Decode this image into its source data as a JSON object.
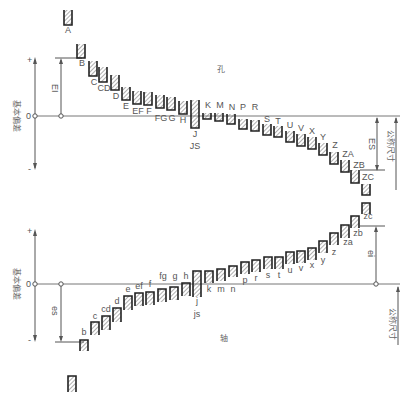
{
  "colors": {
    "line": "#555555",
    "box": "#222222",
    "hatch": "#777777",
    "text": "#555555"
  },
  "top": {
    "name": "孔",
    "axis_label": "基本偏差",
    "plus": "+",
    "minus": "-",
    "zero": "0",
    "dim_left": "EI",
    "dim_right": "ES",
    "size_label": "公称尺寸",
    "zero_y": 116,
    "items": [
      {
        "label": "A",
        "x": 68,
        "y1": 10,
        "y2": 25,
        "lx": 68,
        "ly": 33
      },
      {
        "label": "B",
        "x": 81,
        "y1": 44,
        "y2": 58,
        "lx": 82,
        "ly": 66
      },
      {
        "label": "C",
        "x": 93,
        "y1": 61,
        "y2": 76,
        "lx": 94,
        "ly": 85
      },
      {
        "label": "CD",
        "x": 103,
        "y1": 67,
        "y2": 82,
        "lx": 104,
        "ly": 91
      },
      {
        "label": "D",
        "x": 115,
        "y1": 75,
        "y2": 90,
        "lx": 116,
        "ly": 99
      },
      {
        "label": "E",
        "x": 126,
        "y1": 87,
        "y2": 100,
        "lx": 126,
        "ly": 109
      },
      {
        "label": "EF",
        "x": 137,
        "y1": 91,
        "y2": 104,
        "lx": 138,
        "ly": 114
      },
      {
        "label": "F",
        "x": 148,
        "y1": 92,
        "y2": 105,
        "lx": 149,
        "ly": 114
      },
      {
        "label": "FG",
        "x": 160,
        "y1": 95,
        "y2": 108,
        "lx": 161,
        "ly": 121
      },
      {
        "label": "G",
        "x": 171,
        "y1": 97,
        "y2": 110,
        "lx": 172,
        "ly": 121
      },
      {
        "label": "H",
        "x": 183,
        "y1": 101,
        "y2": 114,
        "lx": 183,
        "ly": 123
      },
      {
        "label": "J",
        "x": 195,
        "y1": 100,
        "y2": 128,
        "lx": 195,
        "ly": 137
      },
      {
        "label": "JS",
        "x": 195,
        "y1": 0,
        "y2": 0,
        "lx": 195,
        "ly": 149
      },
      {
        "label": "K",
        "x": 207,
        "y1": 113,
        "y2": 119,
        "lx": 208,
        "ly": 108
      },
      {
        "label": "M",
        "x": 219,
        "y1": 113,
        "y2": 121,
        "lx": 220,
        "ly": 108
      },
      {
        "label": "N",
        "x": 231,
        "y1": 114,
        "y2": 124,
        "lx": 232,
        "ly": 110
      },
      {
        "label": "P",
        "x": 243,
        "y1": 119,
        "y2": 129,
        "lx": 243,
        "ly": 110
      },
      {
        "label": "R",
        "x": 255,
        "y1": 120,
        "y2": 131,
        "lx": 255,
        "ly": 110
      },
      {
        "label": "S",
        "x": 267,
        "y1": 124,
        "y2": 135,
        "lx": 267,
        "ly": 122
      },
      {
        "label": "T",
        "x": 278,
        "y1": 126,
        "y2": 137,
        "lx": 278,
        "ly": 124
      },
      {
        "label": "U",
        "x": 290,
        "y1": 131,
        "y2": 142,
        "lx": 290,
        "ly": 128
      },
      {
        "label": "V",
        "x": 301,
        "y1": 134,
        "y2": 146,
        "lx": 301,
        "ly": 131
      },
      {
        "label": "X",
        "x": 312,
        "y1": 137,
        "y2": 149,
        "lx": 312,
        "ly": 134
      },
      {
        "label": "Y",
        "x": 323,
        "y1": 143,
        "y2": 155,
        "lx": 323,
        "ly": 140
      },
      {
        "label": "Z",
        "x": 334,
        "y1": 152,
        "y2": 164,
        "lx": 335,
        "ly": 148
      },
      {
        "label": "ZA",
        "x": 345,
        "y1": 160,
        "y2": 172,
        "lx": 348,
        "ly": 157
      },
      {
        "label": "ZB",
        "x": 355,
        "y1": 170,
        "y2": 183,
        "lx": 359,
        "ly": 168
      },
      {
        "label": "ZC",
        "x": 366,
        "y1": 184,
        "y2": 195,
        "lx": 368,
        "ly": 180
      }
    ]
  },
  "bottom": {
    "name": "轴",
    "axis_label": "基本偏差",
    "plus": "+",
    "minus": "-",
    "zero": "0",
    "dim_left": "es",
    "dim_right": "ei",
    "size_label": "公称尺寸",
    "zero_y": 284,
    "items": [
      {
        "label": "b",
        "x": 84,
        "y1": 340,
        "y2": 351,
        "lx": 84,
        "ly": 335
      },
      {
        "label": "c",
        "x": 95,
        "y1": 322,
        "y2": 335,
        "lx": 95,
        "ly": 319
      },
      {
        "label": "cd",
        "x": 106,
        "y1": 316,
        "y2": 330,
        "lx": 106,
        "ly": 312
      },
      {
        "label": "d",
        "x": 117,
        "y1": 308,
        "y2": 322,
        "lx": 117,
        "ly": 304
      },
      {
        "label": "e",
        "x": 128,
        "y1": 296,
        "y2": 310,
        "lx": 128,
        "ly": 292
      },
      {
        "label": "ef",
        "x": 139,
        "y1": 293,
        "y2": 306,
        "lx": 139,
        "ly": 289
      },
      {
        "label": "f",
        "x": 150,
        "y1": 292,
        "y2": 305,
        "lx": 150,
        "ly": 287
      },
      {
        "label": "fg",
        "x": 162,
        "y1": 289,
        "y2": 302,
        "lx": 163,
        "ly": 279
      },
      {
        "label": "g",
        "x": 174,
        "y1": 287,
        "y2": 300,
        "lx": 175,
        "ly": 279
      },
      {
        "label": "h",
        "x": 186,
        "y1": 283,
        "y2": 296,
        "lx": 186,
        "ly": 279
      },
      {
        "label": "j",
        "x": 197,
        "y1": 271,
        "y2": 297,
        "lx": 197,
        "ly": 304
      },
      {
        "label": "js",
        "x": 197,
        "y1": 0,
        "y2": 0,
        "lx": 197,
        "ly": 317
      },
      {
        "label": "k",
        "x": 209,
        "y1": 271,
        "y2": 283,
        "lx": 209,
        "ly": 292
      },
      {
        "label": "m",
        "x": 221,
        "y1": 269,
        "y2": 281,
        "lx": 221,
        "ly": 292
      },
      {
        "label": "n",
        "x": 233,
        "y1": 266,
        "y2": 277,
        "lx": 233,
        "ly": 292
      },
      {
        "label": "p",
        "x": 245,
        "y1": 262,
        "y2": 274,
        "lx": 245,
        "ly": 283
      },
      {
        "label": "r",
        "x": 256,
        "y1": 260,
        "y2": 272,
        "lx": 256,
        "ly": 281
      },
      {
        "label": "s",
        "x": 268,
        "y1": 257,
        "y2": 269,
        "lx": 268,
        "ly": 278
      },
      {
        "label": "t",
        "x": 279,
        "y1": 257,
        "y2": 269,
        "lx": 279,
        "ly": 278
      },
      {
        "label": "u",
        "x": 290,
        "y1": 252,
        "y2": 264,
        "lx": 290,
        "ly": 273
      },
      {
        "label": "v",
        "x": 301,
        "y1": 251,
        "y2": 263,
        "lx": 301,
        "ly": 271
      },
      {
        "label": "x",
        "x": 312,
        "y1": 248,
        "y2": 260,
        "lx": 312,
        "ly": 268
      },
      {
        "label": "y",
        "x": 323,
        "y1": 241,
        "y2": 253,
        "lx": 323,
        "ly": 263
      },
      {
        "label": "z",
        "x": 334,
        "y1": 233,
        "y2": 245,
        "lx": 334,
        "ly": 255
      },
      {
        "label": "za",
        "x": 345,
        "y1": 225,
        "y2": 238,
        "lx": 348,
        "ly": 245
      },
      {
        "label": "zb",
        "x": 355,
        "y1": 216,
        "y2": 228,
        "lx": 358,
        "ly": 236
      },
      {
        "label": "zc",
        "x": 366,
        "y1": 203,
        "y2": 214,
        "lx": 368,
        "ly": 219
      }
    ],
    "extra_box": {
      "x": 72,
      "y1": 376,
      "y2": 392
    }
  }
}
